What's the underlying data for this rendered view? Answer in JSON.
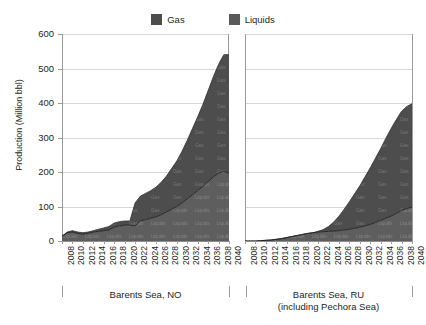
{
  "legend": {
    "items": [
      {
        "label": "Gas",
        "color": "#4d4d4d",
        "name": "legend-item-gas"
      },
      {
        "label": "Liquids",
        "color": "#595959",
        "name": "legend-item-liquids"
      }
    ]
  },
  "axes": {
    "y_label": "Production (Million bbl)",
    "y_ticks": [
      "600",
      "500",
      "400",
      "300",
      "200",
      "100",
      "0"
    ]
  },
  "groups": [
    {
      "caption_line1": "Barents Sea, NO",
      "caption_line2": ""
    },
    {
      "caption_line1": "Barents Sea, RU",
      "caption_line2": "(including Pechora Sea)"
    }
  ],
  "watermark": {
    "gas": "Gas",
    "liquids": "Liquids"
  },
  "colors": {
    "gas_fill": "#4d4d4d",
    "liquids_fill": "#5e5e5e",
    "gridline": "#d7d7d7",
    "axis": "#9a9a9a",
    "text": "#231f20",
    "background": "#ffffff"
  },
  "chart_data": {
    "type": "area",
    "title": "",
    "subtitle": "",
    "xlabel": "",
    "ylabel": "Production (Million bbl)",
    "ylim": [
      0,
      600
    ],
    "ytick_step": 100,
    "grid": true,
    "legend_position": "top-center",
    "stacked": true,
    "stack_order": [
      "Liquids",
      "Gas"
    ],
    "panels": [
      {
        "name": "Barents Sea, NO",
        "caption": "Barents Sea, NO",
        "x": [
          2008,
          2009,
          2010,
          2011,
          2012,
          2013,
          2014,
          2015,
          2016,
          2017,
          2018,
          2019,
          2020,
          2021,
          2022,
          2023,
          2024,
          2025,
          2026,
          2027,
          2028,
          2029,
          2030,
          2031,
          2032,
          2033,
          2034,
          2035,
          2036,
          2037,
          2038,
          2039,
          2040
        ],
        "xticks": [
          2008,
          2010,
          2012,
          2014,
          2016,
          2018,
          2020,
          2022,
          2024,
          2026,
          2028,
          2030,
          2032,
          2034,
          2036,
          2038,
          2040
        ],
        "series": [
          {
            "name": "Liquids",
            "color": "#5e5e5e",
            "values": [
              14,
              24,
              26,
              22,
              20,
              22,
              26,
              28,
              30,
              32,
              40,
              44,
              46,
              46,
              44,
              58,
              62,
              66,
              70,
              76,
              84,
              92,
              100,
              110,
              122,
              134,
              146,
              158,
              172,
              186,
              196,
              202,
              196
            ]
          },
          {
            "name": "Gas",
            "color": "#4d4d4d",
            "values": [
              0,
              2,
              4,
              4,
              4,
              4,
              4,
              6,
              8,
              10,
              12,
              12,
              12,
              12,
              66,
              72,
              76,
              80,
              86,
              94,
              104,
              118,
              132,
              150,
              170,
              192,
              214,
              238,
              264,
              290,
              316,
              338,
              344
            ]
          }
        ],
        "total_peak": 540,
        "total_peak_year": 2039
      },
      {
        "name": "Barents Sea, RU (including Pechora Sea)",
        "caption": "Barents Sea, RU (including Pechora Sea)",
        "x": [
          2008,
          2009,
          2010,
          2011,
          2012,
          2013,
          2014,
          2015,
          2016,
          2017,
          2018,
          2019,
          2020,
          2021,
          2022,
          2023,
          2024,
          2025,
          2026,
          2027,
          2028,
          2029,
          2030,
          2031,
          2032,
          2033,
          2034,
          2035,
          2036,
          2037,
          2038,
          2039,
          2040
        ],
        "xticks": [
          2008,
          2010,
          2012,
          2014,
          2016,
          2018,
          2020,
          2022,
          2024,
          2026,
          2028,
          2030,
          2032,
          2034,
          2036,
          2038,
          2040
        ],
        "series": [
          {
            "name": "Liquids",
            "color": "#5e5e5e",
            "values": [
              0,
              0,
              0,
              1,
              2,
              3,
              5,
              7,
              10,
              13,
              16,
              19,
              22,
              24,
              26,
              27,
              28,
              29,
              30,
              32,
              34,
              37,
              40,
              44,
              48,
              54,
              60,
              66,
              72,
              80,
              88,
              94,
              98
            ]
          },
          {
            "name": "Gas",
            "color": "#4d4d4d",
            "values": [
              0,
              0,
              0,
              0,
              0,
              0,
              0,
              0,
              0,
              0,
              0,
              0,
              0,
              0,
              2,
              6,
              14,
              26,
              42,
              60,
              80,
              100,
              120,
              142,
              164,
              186,
              208,
              232,
              254,
              272,
              288,
              296,
              300
            ]
          }
        ],
        "total_peak": 398,
        "total_peak_year": 2040
      }
    ]
  }
}
